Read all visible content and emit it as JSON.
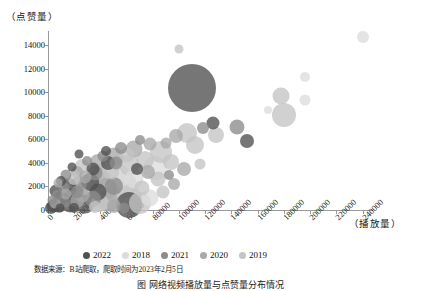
{
  "chart_data": {
    "type": "scatter",
    "title": "",
    "xlabel": "（播放量）",
    "ylabel": "（点赞量）",
    "xlim": [
      0,
      248000
    ],
    "ylim": [
      0,
      15200
    ],
    "grid": false,
    "legend_position": "bottom",
    "xticks": [
      "0",
      "20000",
      "40000",
      "60000",
      "80000",
      "100000",
      "120000",
      "140000",
      "160000",
      "180000",
      "200000",
      "220000",
      "240000"
    ],
    "xtick_values": [
      0,
      20000,
      40000,
      60000,
      80000,
      100000,
      120000,
      140000,
      160000,
      180000,
      200000,
      220000,
      240000
    ],
    "yticks": [
      "0",
      "2000",
      "4000",
      "6000",
      "8000",
      "10000",
      "12000",
      "14000"
    ],
    "ytick_values": [
      0,
      2000,
      4000,
      6000,
      8000,
      10000,
      12000,
      14000
    ],
    "series": [
      {
        "name": "2022",
        "color": "#4f4f4f"
      },
      {
        "name": "2018",
        "color": "#dcdcdc"
      },
      {
        "name": "2021",
        "color": "#8c8c8c"
      },
      {
        "name": "2020",
        "color": "#a8a8a8"
      },
      {
        "name": "2019",
        "color": "#c4c4c4"
      }
    ],
    "points": [
      {
        "x": 110000,
        "y": 10350,
        "size": 48,
        "series": "2022"
      },
      {
        "x": 240000,
        "y": 14700,
        "size": 12,
        "series": "2018"
      },
      {
        "x": 196000,
        "y": 11300,
        "size": 10,
        "series": "2018"
      },
      {
        "x": 100000,
        "y": 13700,
        "size": 9,
        "series": "2019"
      },
      {
        "x": 178000,
        "y": 9700,
        "size": 17,
        "series": "2019"
      },
      {
        "x": 180000,
        "y": 8100,
        "size": 24,
        "series": "2019"
      },
      {
        "x": 168000,
        "y": 8450,
        "size": 8,
        "series": "2018"
      },
      {
        "x": 196000,
        "y": 9300,
        "size": 11,
        "series": "2018"
      },
      {
        "x": 152000,
        "y": 5850,
        "size": 14,
        "series": "2022"
      },
      {
        "x": 144000,
        "y": 7050,
        "size": 15,
        "series": "2021"
      },
      {
        "x": 126000,
        "y": 7350,
        "size": 13,
        "series": "2022"
      },
      {
        "x": 128000,
        "y": 6400,
        "size": 16,
        "series": "2019"
      },
      {
        "x": 118000,
        "y": 6950,
        "size": 12,
        "series": "2021"
      },
      {
        "x": 106000,
        "y": 6550,
        "size": 20,
        "series": "2019"
      },
      {
        "x": 98000,
        "y": 6300,
        "size": 14,
        "series": "2020"
      },
      {
        "x": 112000,
        "y": 5500,
        "size": 18,
        "series": "2019"
      },
      {
        "x": 90000,
        "y": 5700,
        "size": 11,
        "series": "2020"
      },
      {
        "x": 86000,
        "y": 4900,
        "size": 22,
        "series": "2019"
      },
      {
        "x": 78000,
        "y": 5600,
        "size": 13,
        "series": "2020"
      },
      {
        "x": 70000,
        "y": 5950,
        "size": 10,
        "series": "2021"
      },
      {
        "x": 66000,
        "y": 5150,
        "size": 17,
        "series": "2020"
      },
      {
        "x": 60000,
        "y": 4700,
        "size": 15,
        "series": "2019"
      },
      {
        "x": 56000,
        "y": 5300,
        "size": 12,
        "series": "2021"
      },
      {
        "x": 50000,
        "y": 4500,
        "size": 19,
        "series": "2020"
      },
      {
        "x": 46000,
        "y": 3950,
        "size": 14,
        "series": "2022"
      },
      {
        "x": 42000,
        "y": 4600,
        "size": 11,
        "series": "2021"
      },
      {
        "x": 38000,
        "y": 4050,
        "size": 16,
        "series": "2020"
      },
      {
        "x": 34000,
        "y": 3500,
        "size": 13,
        "series": "2022"
      },
      {
        "x": 30000,
        "y": 4200,
        "size": 10,
        "series": "2021"
      },
      {
        "x": 26000,
        "y": 3700,
        "size": 14,
        "series": "2019"
      },
      {
        "x": 22000,
        "y": 3200,
        "size": 12,
        "series": "2020"
      },
      {
        "x": 18000,
        "y": 3650,
        "size": 9,
        "series": "2022"
      },
      {
        "x": 14000,
        "y": 2950,
        "size": 11,
        "series": "2021"
      },
      {
        "x": 10000,
        "y": 2500,
        "size": 10,
        "series": "2022"
      },
      {
        "x": 62000,
        "y": 3850,
        "size": 21,
        "series": "2019"
      },
      {
        "x": 74000,
        "y": 4250,
        "size": 18,
        "series": "2019"
      },
      {
        "x": 82000,
        "y": 3600,
        "size": 24,
        "series": "2018"
      },
      {
        "x": 94000,
        "y": 4100,
        "size": 16,
        "series": "2019"
      },
      {
        "x": 104000,
        "y": 3450,
        "size": 14,
        "series": "2020"
      },
      {
        "x": 116000,
        "y": 3900,
        "size": 11,
        "series": "2019"
      },
      {
        "x": 54000,
        "y": 2900,
        "size": 23,
        "series": "2018"
      },
      {
        "x": 48000,
        "y": 3300,
        "size": 17,
        "series": "2019"
      },
      {
        "x": 40000,
        "y": 2700,
        "size": 20,
        "series": "2020"
      },
      {
        "x": 36000,
        "y": 3100,
        "size": 15,
        "series": "2021"
      },
      {
        "x": 32000,
        "y": 2400,
        "size": 18,
        "series": "2022"
      },
      {
        "x": 28000,
        "y": 2800,
        "size": 13,
        "series": "2020"
      },
      {
        "x": 24000,
        "y": 2250,
        "size": 16,
        "series": "2021"
      },
      {
        "x": 20000,
        "y": 2600,
        "size": 12,
        "series": "2019"
      },
      {
        "x": 16000,
        "y": 2100,
        "size": 14,
        "series": "2022"
      },
      {
        "x": 12000,
        "y": 1850,
        "size": 11,
        "series": "2021"
      },
      {
        "x": 8000,
        "y": 2300,
        "size": 9,
        "series": "2020"
      },
      {
        "x": 6000,
        "y": 1600,
        "size": 13,
        "series": "2022"
      },
      {
        "x": 58000,
        "y": 2150,
        "size": 26,
        "series": "2019"
      },
      {
        "x": 66000,
        "y": 2600,
        "size": 19,
        "series": "2018"
      },
      {
        "x": 72000,
        "y": 1900,
        "size": 15,
        "series": "2019"
      },
      {
        "x": 44000,
        "y": 1750,
        "size": 22,
        "series": "2020"
      },
      {
        "x": 50000,
        "y": 2050,
        "size": 18,
        "series": "2021"
      },
      {
        "x": 38000,
        "y": 1500,
        "size": 17,
        "series": "2022"
      },
      {
        "x": 30000,
        "y": 1700,
        "size": 20,
        "series": "2019"
      },
      {
        "x": 26000,
        "y": 1300,
        "size": 15,
        "series": "2020"
      },
      {
        "x": 22000,
        "y": 1550,
        "size": 13,
        "series": "2021"
      },
      {
        "x": 18000,
        "y": 1150,
        "size": 16,
        "series": "2022"
      },
      {
        "x": 14000,
        "y": 1400,
        "size": 11,
        "series": "2020"
      },
      {
        "x": 10000,
        "y": 1000,
        "size": 14,
        "series": "2022"
      },
      {
        "x": 7000,
        "y": 1250,
        "size": 10,
        "series": "2021"
      },
      {
        "x": 54000,
        "y": 1200,
        "size": 28,
        "series": "2018"
      },
      {
        "x": 60000,
        "y": 900,
        "size": 30,
        "series": "2019"
      },
      {
        "x": 62000,
        "y": 450,
        "size": 26,
        "series": "2022"
      },
      {
        "x": 46000,
        "y": 800,
        "size": 21,
        "series": "2020"
      },
      {
        "x": 40000,
        "y": 600,
        "size": 18,
        "series": "2019"
      },
      {
        "x": 34000,
        "y": 900,
        "size": 16,
        "series": "2021"
      },
      {
        "x": 28000,
        "y": 550,
        "size": 19,
        "series": "2022"
      },
      {
        "x": 22000,
        "y": 750,
        "size": 14,
        "series": "2020"
      },
      {
        "x": 17000,
        "y": 480,
        "size": 17,
        "series": "2022"
      },
      {
        "x": 12000,
        "y": 700,
        "size": 12,
        "series": "2021"
      },
      {
        "x": 8000,
        "y": 400,
        "size": 15,
        "series": "2022"
      },
      {
        "x": 5000,
        "y": 620,
        "size": 11,
        "series": "2020"
      },
      {
        "x": 4000,
        "y": 300,
        "size": 13,
        "series": "2022"
      },
      {
        "x": 3000,
        "y": 850,
        "size": 9,
        "series": "2021"
      },
      {
        "x": 2000,
        "y": 200,
        "size": 12,
        "series": "2022"
      },
      {
        "x": 70000,
        "y": 600,
        "size": 22,
        "series": "2019"
      },
      {
        "x": 78000,
        "y": 1050,
        "size": 17,
        "series": "2018"
      },
      {
        "x": 88000,
        "y": 1500,
        "size": 13,
        "series": "2019"
      },
      {
        "x": 96000,
        "y": 2200,
        "size": 12,
        "series": "2020"
      },
      {
        "x": 84000,
        "y": 2600,
        "size": 15,
        "series": "2019"
      },
      {
        "x": 92000,
        "y": 3000,
        "size": 10,
        "series": "2021"
      },
      {
        "x": 76000,
        "y": 3200,
        "size": 14,
        "series": "2020"
      },
      {
        "x": 68000,
        "y": 3450,
        "size": 12,
        "series": "2022"
      },
      {
        "x": 44000,
        "y": 5050,
        "size": 10,
        "series": "2022"
      },
      {
        "x": 52000,
        "y": 4000,
        "size": 13,
        "series": "2021"
      },
      {
        "x": 24000,
        "y": 4750,
        "size": 9,
        "series": "2022"
      },
      {
        "x": 20000,
        "y": 200,
        "size": 10,
        "series": "2022"
      },
      {
        "x": 36000,
        "y": 250,
        "size": 12,
        "series": "2019"
      },
      {
        "x": 50000,
        "y": 300,
        "size": 14,
        "series": "2020"
      },
      {
        "x": 58000,
        "y": 180,
        "size": 11,
        "series": "2021"
      },
      {
        "x": 9000,
        "y": 150,
        "size": 9,
        "series": "2022"
      }
    ]
  },
  "source_note": "数据来源：B站爬取，爬取时间为2023年2月5日",
  "caption": "图     网络视频播放量与点赞量分布情况"
}
